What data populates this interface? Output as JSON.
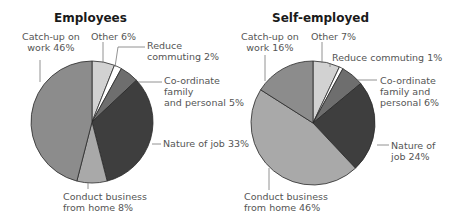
{
  "chart_data": [
    {
      "type": "pie",
      "title": "Employees",
      "start_angle": "12 o'clock, clockwise",
      "categories": [
        "Other",
        "Reduce commuting",
        "Co-ordinate family and personal",
        "Nature of job",
        "Conduct business from home",
        "Catch-up on work"
      ],
      "values": [
        6,
        2,
        5,
        33,
        8,
        46
      ],
      "unit": "%",
      "labels": {
        "other": "Other 6%",
        "reduce": "Reduce\ncommuting 2%",
        "coordinate": "Co-ordinate\nfamily\nand personal 5%",
        "nature": "Nature of job 33%",
        "conduct": "Conduct business\nfrom home 8%",
        "catchup": "Catch-up on\nwork 46%"
      }
    },
    {
      "type": "pie",
      "title": "Self-employed",
      "start_angle": "12 o'clock, clockwise",
      "categories": [
        "Other",
        "Reduce commuting",
        "Co-ordinate family and personal",
        "Nature of job",
        "Conduct business from home",
        "Catch-up on work"
      ],
      "values": [
        7,
        1,
        6,
        24,
        46,
        16
      ],
      "unit": "%",
      "labels": {
        "other": "Other 7%",
        "reduce": "Reduce commuting 1%",
        "coordinate": "Co-ordinate\nfamily and\npersonal 6%",
        "nature": "Nature of\njob 24%",
        "conduct": "Conduct business\nfrom home 46%",
        "catchup": "Catch-up on\nwork 16%"
      }
    }
  ],
  "colors": {
    "other": "#d2d2d2",
    "reduce": "#ffffff",
    "coordinate": "#6e6e6e",
    "nature": "#3e3e3e",
    "conduct": "#a9a9a9",
    "catchup": "#8c8c8c",
    "stroke": "#2a2a2a",
    "leader": "#777777"
  }
}
